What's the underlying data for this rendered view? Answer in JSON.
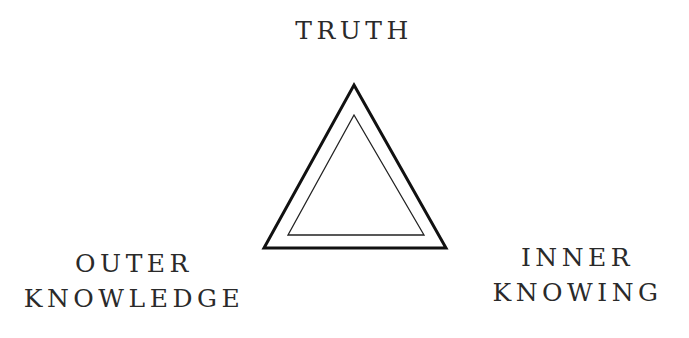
{
  "diagram": {
    "type": "concept-triangle",
    "labels": {
      "top": [
        "TRUTH"
      ],
      "bottom_left": [
        "OUTER",
        "KNOWLEDGE"
      ],
      "bottom_right": [
        "INNER",
        "KNOWING"
      ]
    },
    "shapes": {
      "outer_triangle": {
        "points": [
          [
            354,
            85
          ],
          [
            446,
            248
          ],
          [
            264,
            248
          ]
        ],
        "stroke": "#111111",
        "stroke_width": 3
      },
      "inner_triangle": {
        "points": [
          [
            354,
            115
          ],
          [
            424,
            235
          ],
          [
            288,
            235
          ]
        ],
        "stroke": "#222222",
        "stroke_width": 1.3
      }
    },
    "colors": {
      "background": "#ffffff",
      "text": "#2a2a2a",
      "lines": "#111111"
    }
  }
}
